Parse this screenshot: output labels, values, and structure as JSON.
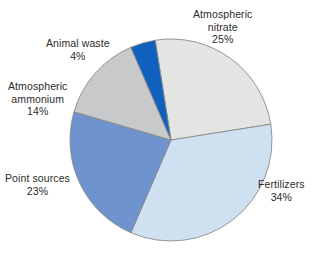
{
  "chart_data": {
    "type": "pie",
    "title": "",
    "subtitle": "",
    "xlabel": "",
    "ylabel": "",
    "legend_position": "none",
    "grid": false,
    "unit": "%",
    "total": 100,
    "categories": [
      "Atmospheric nitrate",
      "Fertilizers",
      "Point sources",
      "Atmospheric ammonium",
      "Animal waste"
    ],
    "values": [
      25,
      34,
      23,
      14,
      4
    ],
    "slices": [
      {
        "label": "Atmospheric nitrate",
        "label_line1": "Atmospheric",
        "label_line2": "nitrate",
        "value": 25,
        "value_text": "25%",
        "color": "#e4e4e3",
        "start_angle": 351,
        "end_angle": 81
      },
      {
        "label": "Fertilizers",
        "label_line1": "Fertilizers",
        "label_line2": "",
        "value": 34,
        "value_text": "34%",
        "color": "#cfe0f0",
        "start_angle": 81,
        "end_angle": 203.4
      },
      {
        "label": "Point sources",
        "label_line1": "Point sources",
        "label_line2": "",
        "value": 23,
        "value_text": "23%",
        "color": "#6f93ce",
        "start_angle": 203.4,
        "end_angle": 286.2
      },
      {
        "label": "Atmospheric ammonium",
        "label_line1": "Atmospheric",
        "label_line2": "ammonium",
        "value": 14,
        "value_text": "14%",
        "color": "#c8c9ca",
        "start_angle": 286.2,
        "end_angle": 336.6
      },
      {
        "label": "Animal waste",
        "label_line1": "Animal waste",
        "label_line2": "",
        "value": 4,
        "value_text": "4%",
        "color": "#1060bd",
        "start_angle": 336.6,
        "end_angle": 351
      }
    ],
    "geometry": {
      "center_x": 171,
      "center_y": 140,
      "radius": 101
    },
    "style": {
      "background": "#ffffff",
      "stroke": "#8a8a8a",
      "text_color": "#2b2b2b"
    }
  }
}
